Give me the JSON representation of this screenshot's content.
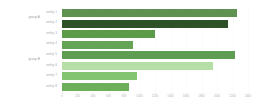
{
  "chart_data": {
    "type": "bar",
    "orientation": "horizontal",
    "title": "",
    "subtitle": "",
    "xlabel": "",
    "ylabel": "",
    "grid": true,
    "legend_position": "none",
    "xlim": [
      0,
      2400
    ],
    "categories": [
      "entity 1",
      "entity 2",
      "entity 3",
      "entity 4",
      "entity 5",
      "entity 6",
      "entity 7",
      "entity 8"
    ],
    "values": [
      2260,
      2140,
      1200,
      915,
      2230,
      1950,
      970,
      865
    ],
    "colors": [
      "#5f9150",
      "#2f5128",
      "#5b9b4a",
      "#66a455",
      "#5f9e52",
      "#b5dfa7",
      "#83c471",
      "#6cae59"
    ],
    "groups": [
      {
        "label": "group A",
        "categories": [
          "entity 1",
          "entity 2",
          "entity 3",
          "entity 4"
        ]
      },
      {
        "label": "group B",
        "categories": [
          "entity 5",
          "entity 6",
          "entity 7",
          "entity 8"
        ]
      }
    ],
    "xticks": [
      0,
      200,
      400,
      600,
      800,
      1000,
      1200,
      1400,
      1600,
      1800,
      2000,
      2200,
      2400
    ],
    "xticklabels": [
      "0",
      "200",
      "400",
      "600",
      "800",
      "1000",
      "1200",
      "1400",
      "1600",
      "1800",
      "2000",
      "2200",
      "2400"
    ]
  },
  "axis": {
    "background": "#ffffff",
    "grid_color": "#fbfbfb",
    "tick_label_color": "#b4b4b4"
  }
}
